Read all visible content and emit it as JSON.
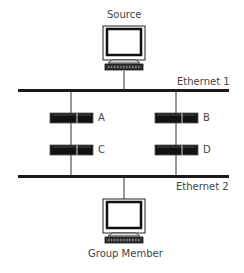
{
  "diagram": {
    "source": {
      "label": "Source"
    },
    "group_member": {
      "label": "Group Member"
    },
    "networks": [
      {
        "label": "Ethernet 1"
      },
      {
        "label": "Ethernet 2"
      }
    ],
    "routers": [
      {
        "label": "A"
      },
      {
        "label": "B"
      },
      {
        "label": "C"
      },
      {
        "label": "D"
      }
    ],
    "colors": {
      "line": "#1a1a1a",
      "text": "#444444",
      "router_fill": "#111111"
    }
  }
}
